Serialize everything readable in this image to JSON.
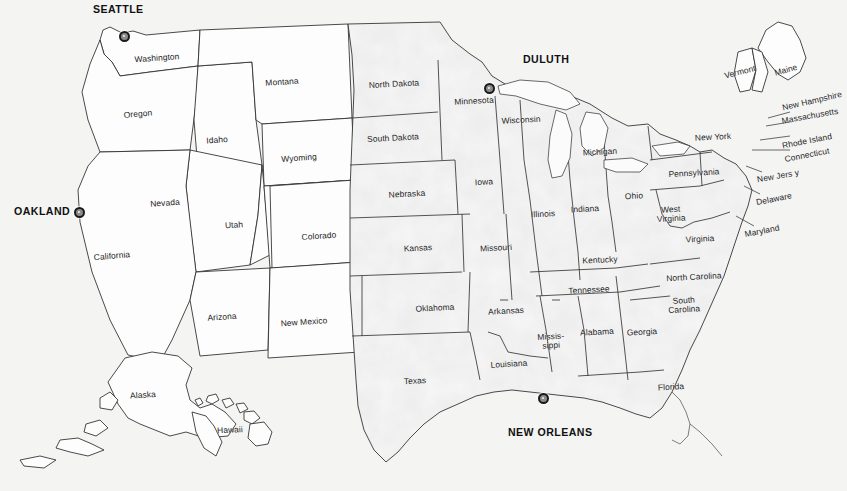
{
  "map": {
    "title_clipped": "United States with major ports highlighted",
    "background_color": "#f4f4f3",
    "shaded_fill": "#ebebeb",
    "unshaded_fill": "#fdfdfd",
    "border_color": "#2b2b2b",
    "label_color": "#1b1b1b",
    "marker_color": "#1a1a1a"
  },
  "cities": [
    {
      "name": "SEATTLE",
      "label_x": 93,
      "label_y": 3,
      "marker_x": 124,
      "marker_y": 36
    },
    {
      "name": "DULUTH",
      "label_x": 523,
      "label_y": 53,
      "marker_x": 489,
      "marker_y": 88
    },
    {
      "name": "OAKLAND",
      "label_x": 14,
      "label_y": 205,
      "marker_x": 79,
      "marker_y": 212
    },
    {
      "name": "NEW ORLEANS",
      "label_x": 508,
      "label_y": 426,
      "marker_x": 543,
      "marker_y": 398
    }
  ],
  "states": [
    {
      "name": "Washington",
      "x": 157,
      "y": 58,
      "rot": -4,
      "shaded": false
    },
    {
      "name": "Oregon",
      "x": 138,
      "y": 114,
      "rot": -5,
      "shaded": false
    },
    {
      "name": "Idaho",
      "x": 217,
      "y": 140,
      "rot": -4,
      "shaded": false
    },
    {
      "name": "Montana",
      "x": 282,
      "y": 82,
      "rot": -4,
      "shaded": false
    },
    {
      "name": "Wyoming",
      "x": 299,
      "y": 158,
      "rot": -4,
      "shaded": false
    },
    {
      "name": "Nevada",
      "x": 165,
      "y": 203,
      "rot": -4,
      "shaded": false
    },
    {
      "name": "Utah",
      "x": 234,
      "y": 225,
      "rot": -4,
      "shaded": false
    },
    {
      "name": "Colorado",
      "x": 319,
      "y": 236,
      "rot": -4,
      "shaded": false
    },
    {
      "name": "California",
      "x": 112,
      "y": 256,
      "rot": -5,
      "shaded": false
    },
    {
      "name": "Arizona",
      "x": 222,
      "y": 317,
      "rot": -4,
      "shaded": false
    },
    {
      "name": "New Mexico",
      "x": 304,
      "y": 322,
      "rot": -4,
      "shaded": false
    },
    {
      "name": "Alaska",
      "x": 143,
      "y": 395,
      "rot": -4,
      "shaded": false
    },
    {
      "name": "Hawaii",
      "x": 230,
      "y": 430,
      "rot": -3,
      "shaded": false
    },
    {
      "name": "North Dakota",
      "x": 394,
      "y": 84,
      "rot": -3,
      "shaded": true
    },
    {
      "name": "South Dakota",
      "x": 393,
      "y": 138,
      "rot": -3,
      "shaded": true
    },
    {
      "name": "Nebraska",
      "x": 407,
      "y": 194,
      "rot": -3,
      "shaded": true
    },
    {
      "name": "Kansas",
      "x": 418,
      "y": 248,
      "rot": -3,
      "shaded": true
    },
    {
      "name": "Oklahoma",
      "x": 435,
      "y": 308,
      "rot": -3,
      "shaded": true
    },
    {
      "name": "Texas",
      "x": 415,
      "y": 381,
      "rot": -3,
      "shaded": true
    },
    {
      "name": "Minnesota",
      "x": 474,
      "y": 101,
      "rot": -3,
      "shaded": true
    },
    {
      "name": "Iowa",
      "x": 484,
      "y": 182,
      "rot": -3,
      "shaded": true
    },
    {
      "name": "Missouri",
      "x": 496,
      "y": 248,
      "rot": -3,
      "shaded": true
    },
    {
      "name": "Arkansas",
      "x": 506,
      "y": 311,
      "rot": -3,
      "shaded": true
    },
    {
      "name": "Louisiana",
      "x": 509,
      "y": 364,
      "rot": -3,
      "shaded": true
    },
    {
      "name": "Wisconsin",
      "x": 521,
      "y": 120,
      "rot": -3,
      "shaded": true
    },
    {
      "name": "Illinois",
      "x": 543,
      "y": 214,
      "rot": -3,
      "shaded": true
    },
    {
      "name": "Missis-\nsippi",
      "x": 551,
      "y": 341,
      "rot": -3,
      "shaded": true
    },
    {
      "name": "Michigan",
      "x": 600,
      "y": 152,
      "rot": -3,
      "shaded": true
    },
    {
      "name": "Indiana",
      "x": 585,
      "y": 209,
      "rot": -3,
      "shaded": true
    },
    {
      "name": "Kentucky",
      "x": 600,
      "y": 260,
      "rot": -3,
      "shaded": true
    },
    {
      "name": "Tennessee",
      "x": 589,
      "y": 290,
      "rot": -3,
      "shaded": true
    },
    {
      "name": "Alabama",
      "x": 597,
      "y": 332,
      "rot": -3,
      "shaded": true
    },
    {
      "name": "Ohio",
      "x": 634,
      "y": 196,
      "rot": -3,
      "shaded": true
    },
    {
      "name": "West\nVirginia",
      "x": 671,
      "y": 214,
      "rot": -3,
      "shaded": true
    },
    {
      "name": "Virginia",
      "x": 700,
      "y": 239,
      "rot": -3,
      "shaded": true
    },
    {
      "name": "North Carolina",
      "x": 694,
      "y": 277,
      "rot": -3,
      "shaded": true
    },
    {
      "name": "South\nCarolina",
      "x": 684,
      "y": 305,
      "rot": -3,
      "shaded": true
    },
    {
      "name": "Georgia",
      "x": 642,
      "y": 332,
      "rot": -3,
      "shaded": true
    },
    {
      "name": "Florida",
      "x": 671,
      "y": 387,
      "rot": -3,
      "shaded": true
    },
    {
      "name": "Pennsylvania",
      "x": 694,
      "y": 173,
      "rot": -3,
      "shaded": true
    },
    {
      "name": "New York",
      "x": 713,
      "y": 137,
      "rot": -3,
      "shaded": true
    },
    {
      "name": "Vermont",
      "x": 740,
      "y": 72,
      "rot": -14,
      "shaded": false
    },
    {
      "name": "Maine",
      "x": 786,
      "y": 70,
      "rot": -16,
      "shaded": false
    },
    {
      "name": "New Hampshire",
      "x": 812,
      "y": 101,
      "rot": -13,
      "shaded": false
    },
    {
      "name": "Massachusetts",
      "x": 810,
      "y": 116,
      "rot": -10,
      "shaded": false
    },
    {
      "name": "Rhode Island",
      "x": 807,
      "y": 141,
      "rot": -11,
      "shaded": false
    },
    {
      "name": "Connecticut",
      "x": 807,
      "y": 155,
      "rot": -11,
      "shaded": false
    },
    {
      "name": "New Jers y",
      "x": 778,
      "y": 176,
      "rot": -10,
      "shaded": false
    },
    {
      "name": "Delaware",
      "x": 774,
      "y": 199,
      "rot": -11,
      "shaded": false
    },
    {
      "name": "Maryland",
      "x": 762,
      "y": 231,
      "rot": -11,
      "shaded": false
    }
  ]
}
